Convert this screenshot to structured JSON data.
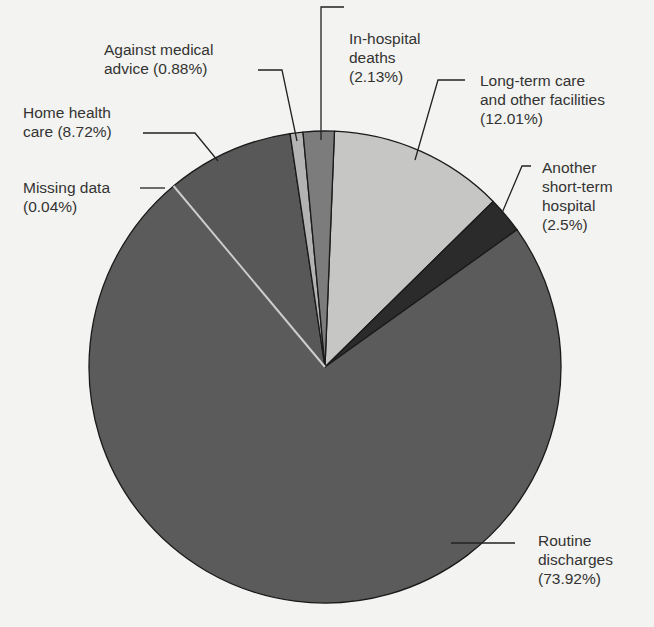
{
  "chart_data": {
    "type": "pie",
    "title": "",
    "start_angle_deg": 2.3,
    "direction": "clockwise",
    "center": [
      325,
      367
    ],
    "radius": 236,
    "slices": [
      {
        "label": "Long-term care and other facilities",
        "value": 12.01,
        "display": "Long-term care\nand other facilities\n(12.01%)",
        "color": "#c6c6c4"
      },
      {
        "label": "Another short-term hospital",
        "value": 2.5,
        "display": "Another\nshort-term\nhospital\n(2.5%)",
        "color": "#2b2b2b"
      },
      {
        "label": "Routine discharges",
        "value": 73.92,
        "display": "Routine\ndischarges\n(73.92%)",
        "color": "#5b5b5b"
      },
      {
        "label": "Missing data",
        "value": 0.04,
        "display": "Missing data\n(0.04%)",
        "color": "#bdbdbd"
      },
      {
        "label": "Home health care",
        "value": 8.72,
        "display": "Home health\ncare (8.72%)",
        "color": "#585858"
      },
      {
        "label": "Against medical advice",
        "value": 0.88,
        "display": "Against medical\nadvice (0.88%)",
        "color": "#b3b3b3"
      },
      {
        "label": "In-hospital deaths",
        "value": 2.13,
        "display": "In-hospital\ndeaths\n(2.13%)",
        "color": "#7c7c7c"
      }
    ],
    "legend": "none (callout labels)"
  },
  "labels": {
    "long_term": "Long-term care\nand other facilities\n(12.01%)",
    "short_term": "Another\nshort-term\nhospital\n(2.5%)",
    "routine": "Routine\ndischarges\n(73.92%)",
    "missing": "Missing data\n(0.04%)",
    "home_health": "Home health\ncare (8.72%)",
    "against_advice": "Against medical\nadvice (0.88%)",
    "in_hospital": "In-hospital\ndeaths\n(2.13%)"
  }
}
